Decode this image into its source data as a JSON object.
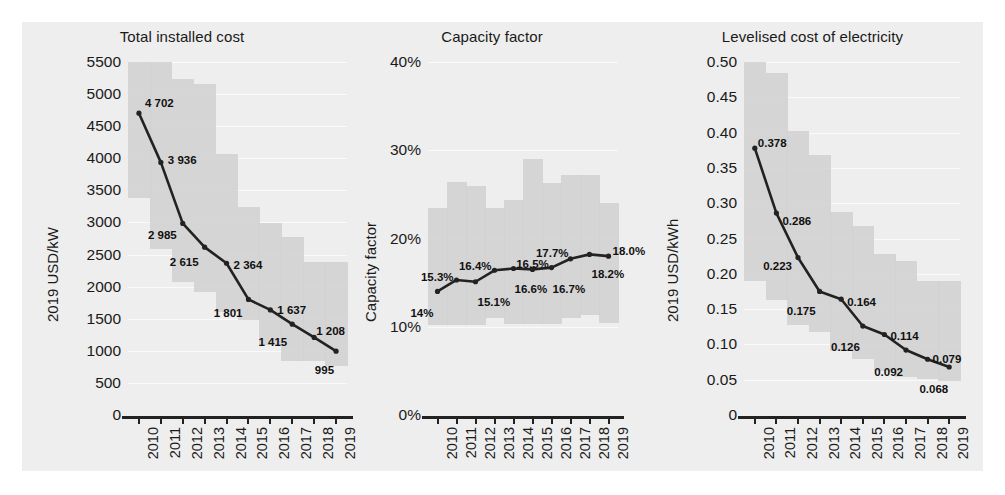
{
  "figure": {
    "background": "#eeeeee",
    "band_color": "#cfcfcf",
    "line_color": "#222222",
    "grid_color": "#fafafa"
  },
  "panels": [
    {
      "title": "Total installed cost",
      "ylabel": "2019 USD/kW",
      "yticks": [
        "0",
        "500",
        "1000",
        "1500",
        "2000",
        "2500",
        "3000",
        "3500",
        "4000",
        "4500",
        "5000",
        "5500"
      ],
      "xticks": [
        "2010",
        "2011",
        "2012",
        "2013",
        "2014",
        "2015",
        "2016",
        "2017",
        "2018",
        "2019"
      ],
      "labels": [
        "4 702",
        "3 936",
        "2 985",
        "2 615",
        "2 364",
        "1 801",
        "1 637",
        "1 415",
        "1 208",
        "995"
      ]
    },
    {
      "title": "Capacity factor",
      "ylabel": "Capacity factor",
      "yticks": [
        "0%",
        "10%",
        "20%",
        "30%",
        "40%"
      ],
      "xticks": [
        "2010",
        "2011",
        "2012",
        "2013",
        "2014",
        "2015",
        "2016",
        "2017",
        "2018",
        "2019"
      ],
      "labels": [
        "14%",
        "15.3%",
        "15.1%",
        "16.4%",
        "16.6%",
        "16.5%",
        "16.7%",
        "17.7%",
        "18.2%",
        "18.0%"
      ]
    },
    {
      "title": "Levelised cost of electricity",
      "ylabel": "2019 USD/kWh",
      "yticks": [
        "0",
        "0.05",
        "0.10",
        "0.15",
        "0.20",
        "0.25",
        "0.30",
        "0.35",
        "0.40",
        "0.45",
        "0.50"
      ],
      "xticks": [
        "2010",
        "2011",
        "2012",
        "2013",
        "2014",
        "2015",
        "2016",
        "2017",
        "2018",
        "2019"
      ],
      "labels": [
        "0.378",
        "0.286",
        "0.223",
        "0.175",
        "0.164",
        "0.126",
        "0.114",
        "0.092",
        "0.079",
        "0.068"
      ]
    }
  ],
  "chart_data": [
    {
      "type": "line",
      "title": "Total installed cost",
      "xlabel": "",
      "ylabel": "2019 USD/kW",
      "x": [
        2010,
        2011,
        2012,
        2013,
        2014,
        2015,
        2016,
        2017,
        2018,
        2019
      ],
      "ylim": [
        0,
        5500
      ],
      "ytick_values": [
        0,
        500,
        1000,
        1500,
        2000,
        2500,
        3000,
        3500,
        4000,
        4500,
        5000,
        5500
      ],
      "grid": true,
      "legend": "none",
      "series": [
        {
          "name": "Weighted average",
          "values": [
            4702,
            3936,
            2985,
            2615,
            2364,
            1801,
            1637,
            1415,
            1208,
            995
          ],
          "data_labels": [
            "4 702",
            "3 936",
            "2 985",
            "2 615",
            "2 364",
            "1 801",
            "1 637",
            "1 415",
            "1 208",
            "995"
          ]
        },
        {
          "name": "5th–95th percentile range band (upper)",
          "values": [
            5500,
            5500,
            5240,
            5160,
            4060,
            3240,
            2990,
            2780,
            2380,
            2380
          ]
        },
        {
          "name": "5th–95th percentile range band (lower)",
          "values": [
            3380,
            2580,
            2070,
            1920,
            1600,
            1480,
            1090,
            840,
            840,
            760
          ]
        }
      ]
    },
    {
      "type": "line",
      "title": "Capacity factor",
      "xlabel": "",
      "ylabel": "Capacity factor",
      "x": [
        2010,
        2011,
        2012,
        2013,
        2014,
        2015,
        2016,
        2017,
        2018,
        2019
      ],
      "ylim": [
        0,
        40
      ],
      "ytick_values": [
        0,
        10,
        20,
        30,
        40
      ],
      "ytick_labels": [
        "0%",
        "10%",
        "20%",
        "30%",
        "40%"
      ],
      "grid": true,
      "legend": "none",
      "series": [
        {
          "name": "Weighted average",
          "values": [
            14.0,
            15.3,
            15.1,
            16.4,
            16.6,
            16.5,
            16.7,
            17.7,
            18.2,
            18.0
          ],
          "data_labels": [
            "14%",
            "15.3%",
            "15.1%",
            "16.4%",
            "16.6%",
            "16.5%",
            "16.7%",
            "17.7%",
            "18.2%",
            "18.0%"
          ]
        },
        {
          "name": "5th–95th percentile range band (upper)",
          "values": [
            23.4,
            26.4,
            25.9,
            23.4,
            24.4,
            29.0,
            26.3,
            27.2,
            27.2,
            24.0
          ]
        },
        {
          "name": "5th–95th percentile range band (lower)",
          "values": [
            10.2,
            10.2,
            10.2,
            11.0,
            10.3,
            10.3,
            10.3,
            11.0,
            11.3,
            10.4
          ]
        }
      ]
    },
    {
      "type": "line",
      "title": "Levelised cost of electricity",
      "xlabel": "",
      "ylabel": "2019 USD/kWh",
      "x": [
        2010,
        2011,
        2012,
        2013,
        2014,
        2015,
        2016,
        2017,
        2018,
        2019
      ],
      "ylim": [
        0,
        0.5
      ],
      "ytick_values": [
        0,
        0.05,
        0.1,
        0.15,
        0.2,
        0.25,
        0.3,
        0.35,
        0.4,
        0.45,
        0.5
      ],
      "grid": true,
      "legend": "none",
      "series": [
        {
          "name": "Weighted average",
          "values": [
            0.378,
            0.286,
            0.223,
            0.175,
            0.164,
            0.126,
            0.114,
            0.092,
            0.079,
            0.068
          ],
          "data_labels": [
            "0.378",
            "0.286",
            "0.223",
            "0.175",
            "0.164",
            "0.126",
            "0.114",
            "0.092",
            "0.079",
            "0.068"
          ]
        },
        {
          "name": "5th–95th percentile range band (upper)",
          "values": [
            0.5,
            0.485,
            0.402,
            0.368,
            0.288,
            0.267,
            0.228,
            0.218,
            0.19,
            0.19
          ]
        },
        {
          "name": "5th–95th percentile range band (lower)",
          "values": [
            0.19,
            0.163,
            0.128,
            0.118,
            0.09,
            0.079,
            0.063,
            0.054,
            0.051,
            0.048
          ]
        }
      ]
    }
  ]
}
